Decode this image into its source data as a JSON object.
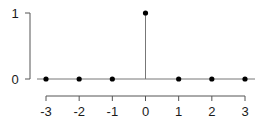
{
  "chart_data": {
    "type": "stem",
    "title": "",
    "xlabel": "",
    "ylabel": "",
    "x": [
      -3,
      -2,
      -1,
      0,
      1,
      2,
      3
    ],
    "values": [
      0,
      0,
      0,
      1,
      0,
      0,
      0
    ],
    "xticks": [
      "-3",
      "-2",
      "-1",
      "0",
      "1",
      "2",
      "3"
    ],
    "yticks": [
      "0",
      "1"
    ],
    "xlim": [
      -3,
      3
    ],
    "ylim": [
      0,
      1
    ],
    "grid": false,
    "legend": null
  },
  "colors": {
    "axis": "#555555",
    "stem": "#777777",
    "marker": "#000000",
    "text": "#1a1a1a"
  }
}
